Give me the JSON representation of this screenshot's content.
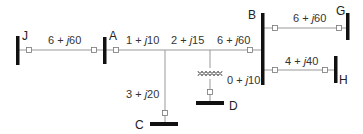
{
  "diagram": {
    "type": "power-system-one-line",
    "colors": {
      "bus": "#111111",
      "line": "#999999",
      "text": "#333333",
      "node_fill": "#ffffff"
    },
    "buses": [
      {
        "id": "J",
        "label": "J"
      },
      {
        "id": "A",
        "label": "A"
      },
      {
        "id": "B",
        "label": "B"
      },
      {
        "id": "C",
        "label": "C"
      },
      {
        "id": "D",
        "label": "D"
      },
      {
        "id": "G",
        "label": "G"
      },
      {
        "id": "H",
        "label": "H"
      }
    ],
    "branches": [
      {
        "from": "J",
        "to": "A",
        "impedance": "6 + j60"
      },
      {
        "from": "A",
        "to": "junction1",
        "impedance": "1 + j10"
      },
      {
        "from": "junction1",
        "to": "junction2",
        "impedance": "2 + j15"
      },
      {
        "from": "junction2",
        "to": "B",
        "impedance": "6 + j60"
      },
      {
        "from": "junction1",
        "to": "C",
        "impedance": "3 + j20"
      },
      {
        "from": "junction2",
        "to": "D",
        "impedance": "0 + j10",
        "element": "transformer"
      },
      {
        "from": "B",
        "to": "G",
        "impedance": "6 + j60"
      },
      {
        "from": "B",
        "to": "H",
        "impedance": "4 + j40"
      }
    ],
    "labels": {
      "JA": "6 + ",
      "JA_j": "j",
      "JA_v": "60",
      "A1": "1 + ",
      "A1_v": "10",
      "12": "2 + ",
      "12_v": "15",
      "2B": "6 + ",
      "2B_v": "60",
      "C": "3 + ",
      "C_v": "20",
      "D": "0 + ",
      "D_v": "10",
      "BG": "6 + ",
      "BG_v": "60",
      "BH": "4 + ",
      "BH_v": "40"
    }
  }
}
